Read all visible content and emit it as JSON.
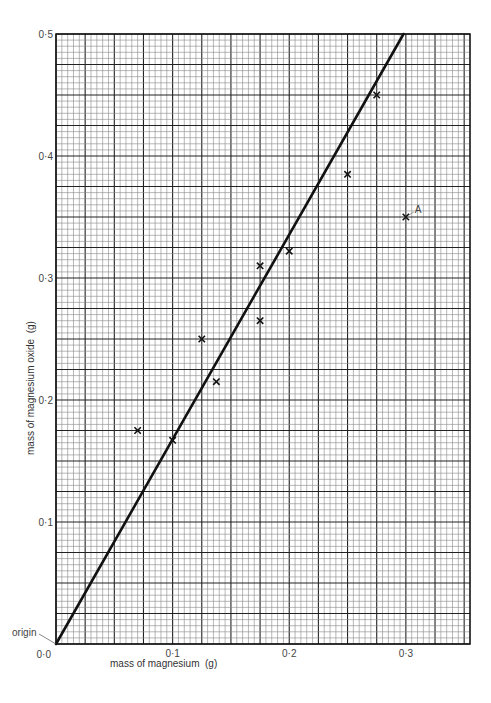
{
  "chart_data": {
    "type": "scatter",
    "title": "",
    "xlabel": "mass of magnesium  (g)",
    "ylabel": "mass of magnesium oxide  (g)",
    "xlim": [
      0,
      0.355
    ],
    "ylim": [
      0,
      0.5
    ],
    "grid": true,
    "grid_minor_step": 0.005,
    "grid_major_step": 0.025,
    "x_ticks": [
      {
        "value": 0.0,
        "label": "0·0"
      },
      {
        "value": 0.1,
        "label": "0·1"
      },
      {
        "value": 0.2,
        "label": "0·2"
      },
      {
        "value": 0.3,
        "label": "0·3"
      }
    ],
    "y_ticks": [
      {
        "value": 0.1,
        "label": "0·1"
      },
      {
        "value": 0.2,
        "label": "0·2"
      },
      {
        "value": 0.3,
        "label": "0·3"
      },
      {
        "value": 0.4,
        "label": "0·4"
      },
      {
        "value": 0.5,
        "label": "0·5"
      }
    ],
    "series": [
      {
        "name": "measurements",
        "marker": "x",
        "points": [
          {
            "x": 0.07,
            "y": 0.175
          },
          {
            "x": 0.1,
            "y": 0.167
          },
          {
            "x": 0.125,
            "y": 0.25
          },
          {
            "x": 0.1375,
            "y": 0.215
          },
          {
            "x": 0.175,
            "y": 0.31
          },
          {
            "x": 0.175,
            "y": 0.265
          },
          {
            "x": 0.2,
            "y": 0.322
          },
          {
            "x": 0.25,
            "y": 0.385
          },
          {
            "x": 0.275,
            "y": 0.45
          },
          {
            "x": 0.3,
            "y": 0.35,
            "label": "A"
          }
        ]
      },
      {
        "name": "line of best fit",
        "type": "line",
        "points": [
          {
            "x": 0.0,
            "y": 0.0
          },
          {
            "x": 0.298,
            "y": 0.5
          }
        ]
      }
    ],
    "annotations": [
      {
        "text": "origin",
        "x": 0.0,
        "y": 0.0
      },
      {
        "text": "A",
        "x": 0.3,
        "y": 0.35
      }
    ]
  }
}
